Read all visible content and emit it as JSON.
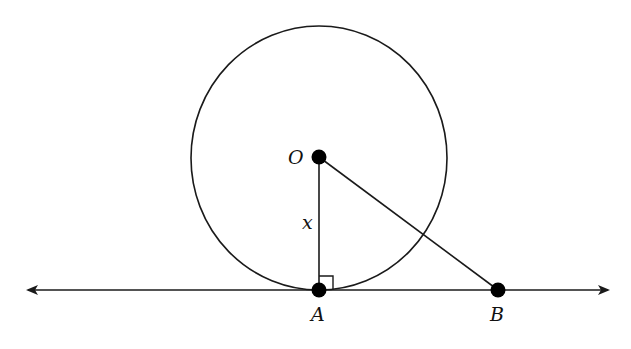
{
  "diagram": {
    "type": "geometry",
    "colors": {
      "stroke": "#1a1a1a",
      "point": "#000000",
      "background": "#ffffff"
    },
    "circle": {
      "cx": 319,
      "cy": 158,
      "rx": 128,
      "ry": 132
    },
    "line": {
      "y": 290,
      "x1": 28,
      "x2": 608,
      "arrows": "both"
    },
    "points": {
      "O": {
        "label": "O",
        "x": 319,
        "y": 157
      },
      "A": {
        "label": "A",
        "x": 319,
        "y": 290
      },
      "B": {
        "label": "B",
        "x": 498,
        "y": 290
      }
    },
    "segments": [
      {
        "name": "OA",
        "from": "O",
        "to": "A",
        "label": "x"
      },
      {
        "name": "OB",
        "from": "O",
        "to": "B",
        "label": ""
      }
    ],
    "right_angle_marker": {
      "at": "A",
      "size": 13
    },
    "labels": {
      "O": "O",
      "A": "A",
      "B": "B",
      "OA_length": "x"
    }
  }
}
